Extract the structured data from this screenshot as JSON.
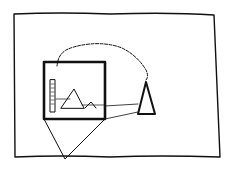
{
  "sketch": {
    "description": "Hand-drawn sketch: outer frame containing a framed picture of mountains and a tower, connected by a coiled line to a triangle stand",
    "stroke_color": "#111111",
    "background": "#ffffff"
  }
}
